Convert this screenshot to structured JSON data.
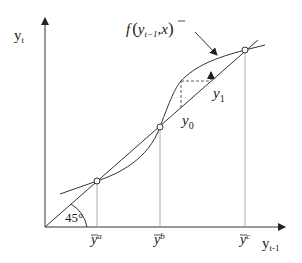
{
  "diagram": {
    "y_axis_label": "y",
    "y_axis_sub": "t",
    "x_axis_label": "y",
    "x_axis_sub": "t-1",
    "function_label": {
      "f": "f",
      "args_open": "(",
      "y": "y",
      "y_sub": "t−1",
      "sep": ",",
      "x": "x",
      "args_close": ")"
    },
    "angle_label": "45°",
    "iterate_labels": {
      "y0": "y",
      "y0_sub": "0",
      "y1": "y",
      "y1_sub": "1"
    },
    "equilibria": [
      {
        "name": "a",
        "label": "y",
        "sup": "a"
      },
      {
        "name": "b",
        "label": "y",
        "sup": "b"
      },
      {
        "name": "c",
        "label": "y",
        "sup": "c"
      }
    ],
    "colors": {
      "line": "#333333",
      "guide": "#999999",
      "background": "#ffffff"
    }
  }
}
